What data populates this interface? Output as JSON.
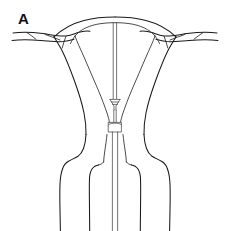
{
  "figure": {
    "panel_label": "A",
    "caption": "",
    "background_color": "#ffffff",
    "line_color": "#1a1a1a",
    "accent_color": "#2b2b2b"
  },
  "structures": {
    "fundus": "uterine fundus",
    "uterine_body": "uterine body",
    "endometrial_cavity": "endometrial cavity",
    "left_fallopian_tube": "left fallopian tube",
    "right_fallopian_tube": "right fallopian tube",
    "left_cornu": "left uterine cornu",
    "right_cornu": "right uterine cornu",
    "cervix": "cervix",
    "external_os": "external cervical os",
    "vaginal_wall_left": "left vaginal wall",
    "vaginal_wall_right": "right vaginal wall",
    "anterior_fornix": "anterior vaginal fornix"
  },
  "instrument": {
    "name": "transcervical catheter",
    "shaft": "catheter shaft",
    "tip_device": "catheter tip applicator",
    "cervical_stopper": "cervical stopper collar"
  }
}
